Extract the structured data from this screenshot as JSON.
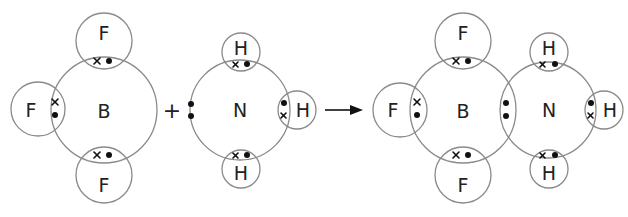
{
  "diagram": {
    "title": "",
    "reaction": {
      "plus_sign": "+",
      "arrow": "→"
    },
    "reactant_bf3": {
      "central": "B",
      "atoms": [
        {
          "position": "top",
          "label": "F"
        },
        {
          "position": "left",
          "label": "F"
        },
        {
          "position": "bottom",
          "label": "F"
        }
      ]
    },
    "reactant_nh3": {
      "central": "N",
      "lone_pair": "left",
      "atoms": [
        {
          "position": "top",
          "label": "H"
        },
        {
          "position": "right",
          "label": "H"
        },
        {
          "position": "bottom",
          "label": "H"
        }
      ]
    },
    "product_bf3nh3": {
      "boron_center": "B",
      "nitrogen_center": "N",
      "dative_bond": "N→B shared lone pair",
      "atoms": [
        {
          "position": "top-B",
          "label": "F"
        },
        {
          "position": "left-B",
          "label": "F"
        },
        {
          "position": "bottom-B",
          "label": "F"
        },
        {
          "position": "top-N",
          "label": "H"
        },
        {
          "position": "right-N",
          "label": "H"
        },
        {
          "position": "bottom-N",
          "label": "H"
        }
      ]
    },
    "legend": {
      "cross": "×",
      "dot": "•"
    },
    "colors": {
      "shell_stroke": "#8a8a8a",
      "text": "#222222",
      "electron": "#111111",
      "background": "#ffffff"
    }
  }
}
